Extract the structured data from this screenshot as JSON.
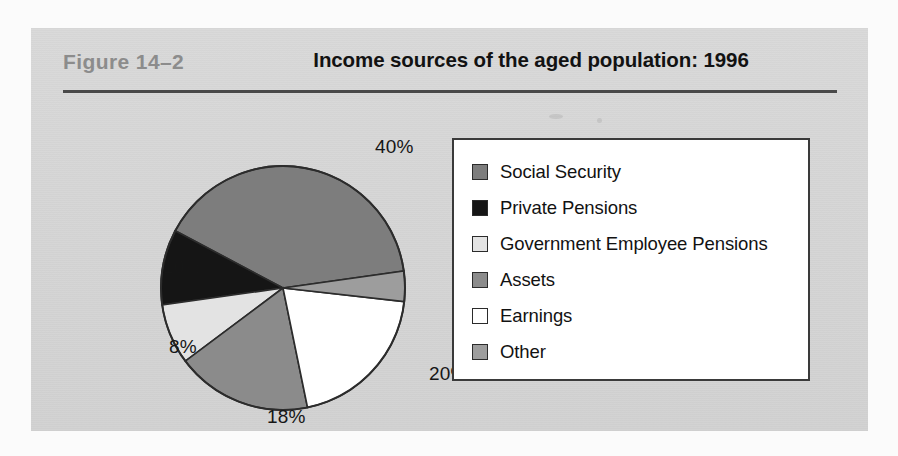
{
  "figure": {
    "label": "Figure  14–2",
    "title": "Income sources of the aged population: 1996"
  },
  "legend": {
    "items": [
      {
        "label": "Social Security",
        "color": "#7d7d7d"
      },
      {
        "label": "Private Pensions",
        "color": "#151515"
      },
      {
        "label": "Government Employee Pensions",
        "color": "#e3e3e3"
      },
      {
        "label": "Assets",
        "color": "#8b8b8b"
      },
      {
        "label": "Earnings",
        "color": "#ffffff"
      },
      {
        "label": "Other",
        "color": "#9d9d9d"
      }
    ]
  },
  "chart_data": {
    "type": "pie",
    "title": "Income sources of the aged population: 1996",
    "categories": [
      "Social Security",
      "Private Pensions",
      "Government Employee Pensions",
      "Assets",
      "Earnings",
      "Other"
    ],
    "values": [
      40,
      10,
      8,
      18,
      20,
      4
    ],
    "value_labels": [
      "40%",
      "10%",
      "8%",
      "18%",
      "20%",
      "4%"
    ],
    "colors": [
      "#7d7d7d",
      "#151515",
      "#e3e3e3",
      "#8b8b8b",
      "#ffffff",
      "#9d9d9d"
    ],
    "units": "percent",
    "total": 100,
    "start_angle_deg": -8,
    "direction": "counterclockwise",
    "legend_position": "right",
    "grid": false,
    "xlabel": "",
    "ylabel": ""
  },
  "pie_labels": [
    {
      "text": "40%",
      "left": 284,
      "top": 38
    },
    {
      "text": "4%",
      "left": 382,
      "top": 160
    },
    {
      "text": "20%",
      "left": 338,
      "top": 265
    },
    {
      "text": "18%",
      "left": 176,
      "top": 308
    },
    {
      "text": "8%",
      "left": 78,
      "top": 238
    },
    {
      "text": "10%",
      "left": 72,
      "top": 158
    }
  ]
}
